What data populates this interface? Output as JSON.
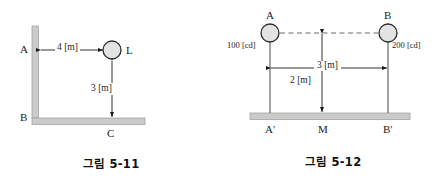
{
  "page": {
    "background": "#ffffff",
    "ink": "#1c1c1c",
    "hatch_fill": "#cfcfcf",
    "hatch_stroke": "#8a8a8a",
    "lamp_fill": "#e6e6e6",
    "lamp_stroke": "#2b2b2b"
  },
  "figures": [
    {
      "id": "fig-5-11",
      "caption": "그림 5-11",
      "kind": "wall-and-floor-with-lamp",
      "labels": {
        "wall_top": "A",
        "wall_corner": "B",
        "floor_point": "C",
        "lamp": "L",
        "horizontal_distance": "4 [m]",
        "vertical_distance": "3 [m]"
      },
      "geometry": {
        "wall_x": 35,
        "wall_top_y": 26,
        "floor_y": 118,
        "floor_right_x": 145,
        "lamp_x": 112,
        "lamp_y": 50,
        "lamp_r": 9,
        "dim_h_y": 50,
        "dim_v_x": 112
      }
    },
    {
      "id": "fig-5-12",
      "caption": "그림 5-12",
      "kind": "two-lamps-over-ground",
      "labels": {
        "lamp_a": "A",
        "lamp_b": "B",
        "lamp_a_intensity": "100 [cd]",
        "lamp_b_intensity": "200 [cd]",
        "foot_a": "A′",
        "midpoint": "M",
        "foot_b": "B′",
        "span_distance": "3 [m]",
        "height_distance": "2 [m]"
      },
      "geometry": {
        "lamp_a_x": 48,
        "lamp_b_x": 166,
        "lamp_y": 33,
        "lamp_r": 9,
        "ground_y": 114,
        "ground_left_x": 30,
        "ground_right_x": 186,
        "mid_x": 100,
        "dim_span_y": 68,
        "dashed_y": 33
      }
    }
  ]
}
